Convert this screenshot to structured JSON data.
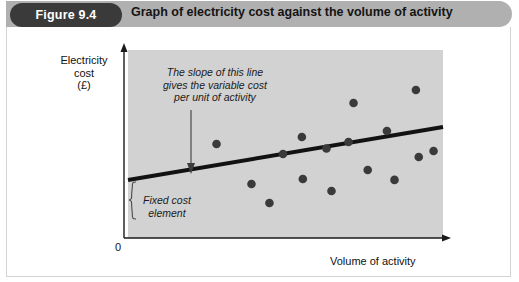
{
  "figure": {
    "badge_label": "Figure 9.4",
    "title": "Graph of electricity cost against the volume of activity",
    "badge_color": "#3a3a3a",
    "header_color": "#b0b0b0",
    "panel_color": "#ffffff",
    "border_color": "#d3d3d3"
  },
  "chart_data": {
    "type": "scatter",
    "title": "Graph of electricity cost against the volume of activity",
    "xlabel": "Volume of activity",
    "ylabel": "Electricity cost (£)",
    "ylabel_lines": [
      "Electricity",
      "cost",
      "(£)"
    ],
    "origin_label": "0",
    "grid": false,
    "legend": "none",
    "plot_area_color": "#d2d2d2",
    "axis_color": "#1a1a1a",
    "xlim": [
      0,
      100
    ],
    "ylim": [
      0,
      100
    ],
    "x_ticks": [],
    "y_ticks": [],
    "points": [
      {
        "x": 28.1,
        "y": 50.0
      },
      {
        "x": 39.2,
        "y": 28.7
      },
      {
        "x": 44.9,
        "y": 18.6
      },
      {
        "x": 49.2,
        "y": 44.7
      },
      {
        "x": 55.2,
        "y": 53.7
      },
      {
        "x": 55.5,
        "y": 31.4
      },
      {
        "x": 63.0,
        "y": 47.6
      },
      {
        "x": 64.6,
        "y": 25.0
      },
      {
        "x": 70.0,
        "y": 51.1
      },
      {
        "x": 71.6,
        "y": 71.8
      },
      {
        "x": 76.1,
        "y": 36.2
      },
      {
        "x": 82.2,
        "y": 56.9
      },
      {
        "x": 84.6,
        "y": 30.9
      },
      {
        "x": 91.4,
        "y": 78.7
      },
      {
        "x": 92.3,
        "y": 43.1
      },
      {
        "x": 97.0,
        "y": 46.3
      }
    ],
    "trend_line": {
      "label": "cost line",
      "x0": 0.0,
      "y0": 30.9,
      "x1": 100.0,
      "y1": 59.0,
      "description": "Straight line with positive intercept (fixed cost) and positive slope (variable cost per unit)"
    },
    "annotations": [
      {
        "name": "slope-annotation",
        "lines": [
          "The slope of this line",
          "gives the variable cost",
          "per unit of activity"
        ],
        "arrow": "points down to the trend line"
      },
      {
        "name": "fixed-cost-annotation",
        "lines": [
          "Fixed cost",
          "element"
        ],
        "brace": "vertical curly brace from origin up to the trend line intercept"
      }
    ]
  }
}
